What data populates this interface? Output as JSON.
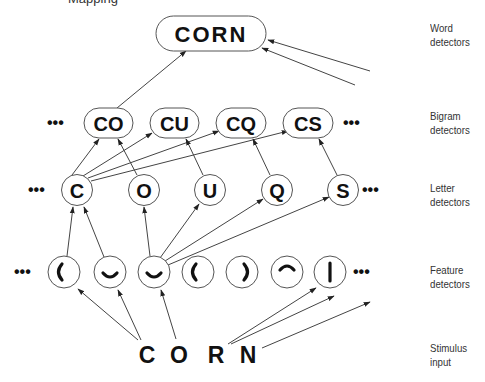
{
  "title_fragment": "Mapping",
  "layers": {
    "word": {
      "label_line1": "Word",
      "label_line2": "detectors"
    },
    "bigram": {
      "label_line1": "Bigram",
      "label_line2": "detectors"
    },
    "letter": {
      "label_line1": "Letter",
      "label_line2": "detectors"
    },
    "feature": {
      "label_line1": "Feature",
      "label_line2": "detectors"
    },
    "stimulus": {
      "label_line1": "Stimulus",
      "label_line2": "input"
    }
  },
  "ellipsis": "•••",
  "word_nodes": [
    {
      "id": "CORN",
      "label": "CORN",
      "cx": 211,
      "cy": 33
    }
  ],
  "bigram_nodes": [
    {
      "id": "CO",
      "label": "CO",
      "cx": 108,
      "cy": 123
    },
    {
      "id": "CU",
      "label": "CU",
      "cx": 175,
      "cy": 123
    },
    {
      "id": "CQ",
      "label": "CQ",
      "cx": 241,
      "cy": 123
    },
    {
      "id": "CS",
      "label": "CS",
      "cx": 308,
      "cy": 123
    }
  ],
  "letter_nodes": [
    {
      "id": "C",
      "label": "C",
      "cx": 77,
      "cy": 190
    },
    {
      "id": "O",
      "label": "O",
      "cx": 144,
      "cy": 190
    },
    {
      "id": "U",
      "label": "U",
      "cx": 210,
      "cy": 190
    },
    {
      "id": "Q",
      "label": "Q",
      "cx": 277,
      "cy": 190
    },
    {
      "id": "S",
      "label": "S",
      "cx": 343,
      "cy": 190
    }
  ],
  "feature_nodes": [
    {
      "id": "f1",
      "feature": "left-curve",
      "cx": 64,
      "cy": 272
    },
    {
      "id": "f2",
      "feature": "bottom-curve",
      "cx": 110,
      "cy": 272
    },
    {
      "id": "f3",
      "feature": "bottom-curve",
      "cx": 154,
      "cy": 272
    },
    {
      "id": "f4",
      "feature": "left-curve",
      "cx": 198,
      "cy": 272
    },
    {
      "id": "f5",
      "feature": "right-curve",
      "cx": 242,
      "cy": 272
    },
    {
      "id": "f6",
      "feature": "top-curve",
      "cx": 287,
      "cy": 272
    },
    {
      "id": "f7",
      "feature": "vertical-line",
      "cx": 330,
      "cy": 272
    }
  ],
  "stimulus": {
    "letters": [
      {
        "label": "C",
        "x": 147,
        "y": 355
      },
      {
        "label": "O",
        "x": 179,
        "y": 355
      },
      {
        "label": "R",
        "x": 216,
        "y": 355
      },
      {
        "label": "N",
        "x": 248,
        "y": 355
      }
    ]
  },
  "connections": [
    {
      "from": "C-stim",
      "to": "f1"
    },
    {
      "from": "C-stim",
      "to": "f2"
    },
    {
      "from": "O-stim",
      "to": "f3"
    },
    {
      "from": "N-stim",
      "to": "f7"
    },
    {
      "from": "N-stim",
      "to": "offscreen"
    },
    {
      "from": "N-stim",
      "to": "offscreen"
    },
    {
      "from": "f1",
      "to": "C"
    },
    {
      "from": "f2",
      "to": "C"
    },
    {
      "from": "f3",
      "to": "O"
    },
    {
      "from": "f3",
      "to": "U"
    },
    {
      "from": "f3",
      "to": "Q"
    },
    {
      "from": "f3",
      "to": "S"
    },
    {
      "from": "C",
      "to": "CO"
    },
    {
      "from": "C",
      "to": "CU"
    },
    {
      "from": "C",
      "to": "CQ"
    },
    {
      "from": "C",
      "to": "CS"
    },
    {
      "from": "O",
      "to": "CO"
    },
    {
      "from": "U",
      "to": "CU"
    },
    {
      "from": "Q",
      "to": "CQ"
    },
    {
      "from": "S",
      "to": "CS"
    },
    {
      "from": "CO",
      "to": "CORN"
    },
    {
      "from": "offscreen",
      "to": "CORN"
    },
    {
      "from": "offscreen",
      "to": "CORN"
    }
  ],
  "colors": {
    "stroke": "#444444",
    "node_stroke": "#555555",
    "text": "#111111",
    "label": "#333333"
  }
}
